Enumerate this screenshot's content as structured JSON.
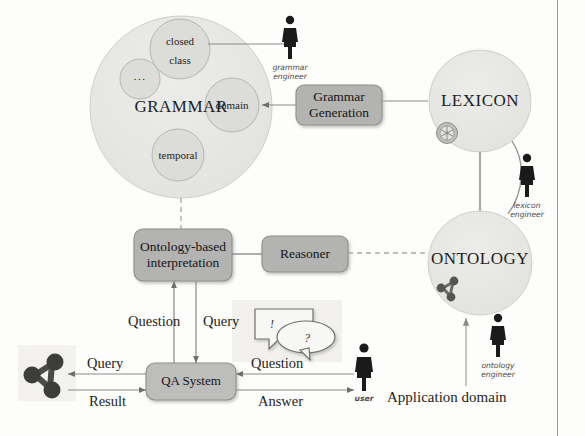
{
  "diagram": {
    "colors": {
      "circle_fill": "#e6e6e4",
      "circle_stroke": "#c9c9c6",
      "subcircle_fill": "#dcdcd9",
      "subcircle_stroke": "#b9b9b5",
      "box_fill": "#b3b3b1",
      "box_stroke": "#8f8f8d",
      "qa_box_fill": "#bdbdbb",
      "line": "#8a8a88",
      "text": "#1d1d1d",
      "person": "#1a1a1a",
      "border": "#9a9a9a"
    },
    "nodes": {
      "grammar": {
        "label": "GRAMMAR"
      },
      "lexicon": {
        "label": "LEXICON"
      },
      "ontology": {
        "label": "ONTOLOGY"
      },
      "grammar_subcircles": [
        {
          "label_line1": "closed",
          "label_line2": "class"
        },
        {
          "label_line1": "...",
          "label_line2": ""
        },
        {
          "label_line1": "domain",
          "label_line2": ""
        },
        {
          "label_line1": "temporal",
          "label_line2": ""
        }
      ]
    },
    "boxes": [
      {
        "id": "grammar-generation",
        "line1": "Grammar",
        "line2": "Generation"
      },
      {
        "id": "ontology-based-interpretation",
        "line1": "Ontology-based",
        "line2": "interpretation"
      },
      {
        "id": "reasoner",
        "line1": "Reasoner",
        "line2": ""
      },
      {
        "id": "qa-system",
        "line1": "QA System",
        "line2": ""
      }
    ],
    "actors": [
      {
        "id": "grammar-engineer",
        "line1": "grammar",
        "line2": "engineer"
      },
      {
        "id": "lexicon-engineer",
        "line1": "lexicon",
        "line2": "engineer"
      },
      {
        "id": "ontology-engineer",
        "line1": "ontology",
        "line2": "engineer"
      },
      {
        "id": "user",
        "line1": "user",
        "line2": ""
      }
    ],
    "edge_labels": {
      "question_to_interpretation": "Question",
      "query_to_interpretation": "Query",
      "query_left": "Query",
      "result_left": "Result",
      "question_right": "Question",
      "answer_right": "Answer"
    },
    "captions": {
      "application_domain": "Application domain"
    },
    "bubbles": {
      "exclamation": "!",
      "question": "?"
    },
    "icons": {
      "lexicon_marker": "asterisk-wheel-icon",
      "ontology_marker": "graph-nodes-icon",
      "kb_left": "graph-nodes-icon",
      "speech": "speech-bubbles-icon"
    }
  }
}
